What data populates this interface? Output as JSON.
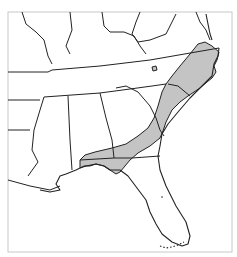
{
  "map": {
    "title": "",
    "region": "Southeastern United States",
    "colors": {
      "background": "#ffffff",
      "frame": "#c8c8c8",
      "boundary": "#222222",
      "range_fill": "#c4c4c4"
    },
    "layers": {
      "state_boundaries": "state-outline",
      "shaded_range": "distribution-range",
      "enclave": "isolated-population"
    }
  }
}
